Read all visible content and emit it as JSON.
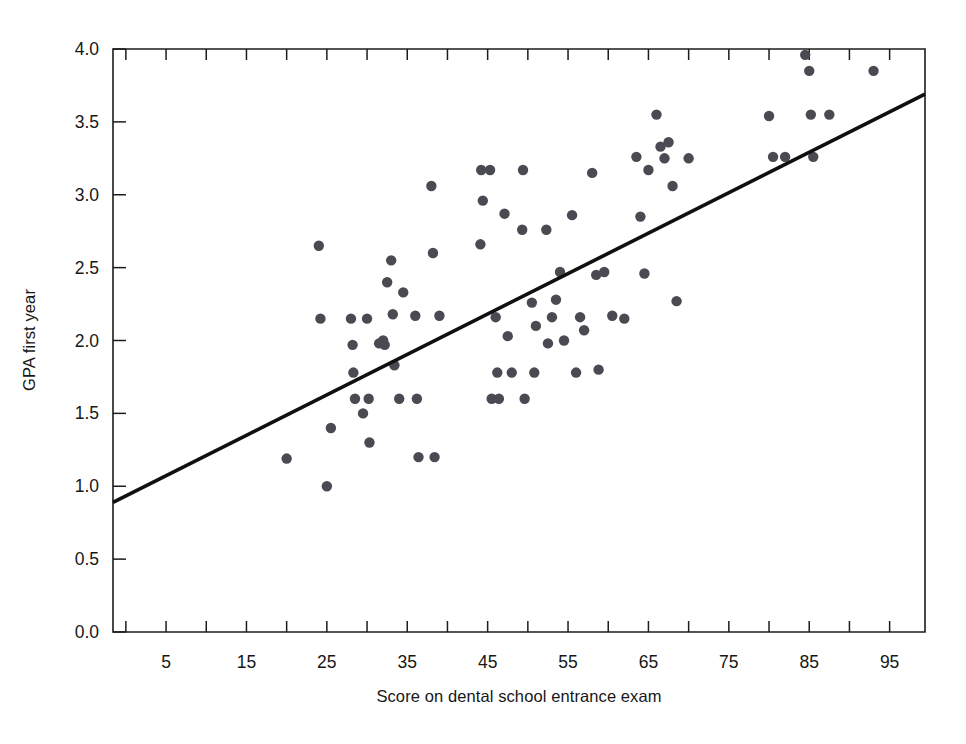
{
  "chart_data": {
    "type": "scatter",
    "title": "",
    "subtitle": "",
    "xlabel": "Score on dental school entrance exam",
    "ylabel": "GPA first year",
    "xlim": [
      -1.6,
      99.4
    ],
    "ylim": [
      0.0,
      4.0
    ],
    "grid": false,
    "legend": null,
    "x_ticks_major": [
      5,
      15,
      25,
      35,
      45,
      55,
      65,
      75,
      85,
      95
    ],
    "x_tick_labels": [
      "5",
      "15",
      "25",
      "35",
      "45",
      "55",
      "65",
      "75",
      "85",
      "95"
    ],
    "x_ticks_all": [
      0,
      5,
      10,
      15,
      20,
      25,
      30,
      35,
      40,
      45,
      50,
      55,
      60,
      65,
      70,
      75,
      80,
      85,
      90,
      95
    ],
    "y_ticks": [
      0.0,
      0.5,
      1.0,
      1.5,
      2.0,
      2.5,
      3.0,
      3.5,
      4.0
    ],
    "y_tick_labels": [
      "0.0",
      "0.5",
      "1.0",
      "1.5",
      "2.0",
      "2.5",
      "3.0",
      "3.5",
      "4.0"
    ],
    "marker_color": "#4a4a52",
    "marker_size": 5.2,
    "line_color": "#101010",
    "trendline": {
      "type": "linear-fit",
      "x_start": -1.6,
      "y_start": 0.89,
      "x_end": 99.4,
      "y_end": 3.69,
      "slope": 0.0277,
      "intercept": 0.934
    },
    "points": [
      [
        20.0,
        1.19
      ],
      [
        24.0,
        2.65
      ],
      [
        24.2,
        2.15
      ],
      [
        25.0,
        1.0
      ],
      [
        25.5,
        1.4
      ],
      [
        28.0,
        2.15
      ],
      [
        28.2,
        1.97
      ],
      [
        28.3,
        1.78
      ],
      [
        28.5,
        1.6
      ],
      [
        29.5,
        1.5
      ],
      [
        30.0,
        2.15
      ],
      [
        30.2,
        1.6
      ],
      [
        30.3,
        1.3
      ],
      [
        31.5,
        1.98
      ],
      [
        32.0,
        2.0
      ],
      [
        32.2,
        1.97
      ],
      [
        32.5,
        2.4
      ],
      [
        33.0,
        2.55
      ],
      [
        33.2,
        2.18
      ],
      [
        33.4,
        1.83
      ],
      [
        34.0,
        1.6
      ],
      [
        34.5,
        2.33
      ],
      [
        36.0,
        2.17
      ],
      [
        36.2,
        1.6
      ],
      [
        36.4,
        1.2
      ],
      [
        38.0,
        3.06
      ],
      [
        38.2,
        2.6
      ],
      [
        38.4,
        1.2
      ],
      [
        39.0,
        2.17
      ],
      [
        44.1,
        2.66
      ],
      [
        44.2,
        3.17
      ],
      [
        44.4,
        2.96
      ],
      [
        45.3,
        3.17
      ],
      [
        45.5,
        1.6
      ],
      [
        46.0,
        2.16
      ],
      [
        46.2,
        1.78
      ],
      [
        46.4,
        1.6
      ],
      [
        47.1,
        2.87
      ],
      [
        47.5,
        2.03
      ],
      [
        48.0,
        1.78
      ],
      [
        49.3,
        2.76
      ],
      [
        49.4,
        3.17
      ],
      [
        49.6,
        1.6
      ],
      [
        50.5,
        2.26
      ],
      [
        50.8,
        1.78
      ],
      [
        51.0,
        2.1
      ],
      [
        52.3,
        2.76
      ],
      [
        52.5,
        1.98
      ],
      [
        53.0,
        2.16
      ],
      [
        53.5,
        2.28
      ],
      [
        54.0,
        2.47
      ],
      [
        54.5,
        2.0
      ],
      [
        55.5,
        2.86
      ],
      [
        56.0,
        1.78
      ],
      [
        56.5,
        2.16
      ],
      [
        57.0,
        2.07
      ],
      [
        58.0,
        3.15
      ],
      [
        58.5,
        2.45
      ],
      [
        58.8,
        1.8
      ],
      [
        59.5,
        2.47
      ],
      [
        60.5,
        2.17
      ],
      [
        62.0,
        2.15
      ],
      [
        63.5,
        3.26
      ],
      [
        64.0,
        2.85
      ],
      [
        64.5,
        2.46
      ],
      [
        65.0,
        3.17
      ],
      [
        66.0,
        3.55
      ],
      [
        66.5,
        3.33
      ],
      [
        67.0,
        3.25
      ],
      [
        67.5,
        3.36
      ],
      [
        68.0,
        3.06
      ],
      [
        68.5,
        2.27
      ],
      [
        70.0,
        3.25
      ],
      [
        80.0,
        3.54
      ],
      [
        80.5,
        3.26
      ],
      [
        82.0,
        3.26
      ],
      [
        84.5,
        3.96
      ],
      [
        85.0,
        3.85
      ],
      [
        85.2,
        3.55
      ],
      [
        85.5,
        3.26
      ],
      [
        87.5,
        3.55
      ],
      [
        93.0,
        3.85
      ]
    ]
  }
}
